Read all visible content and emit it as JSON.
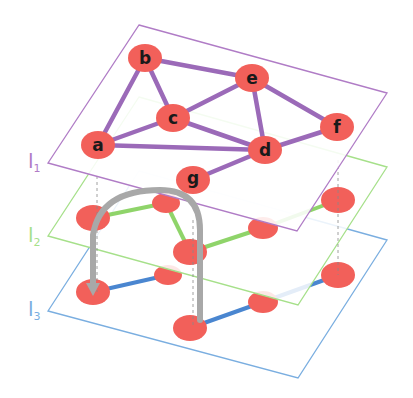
{
  "diagram": {
    "type": "multilayer-network",
    "colors": {
      "node": "#f2605a",
      "l1": "#b07cc6",
      "l1_edge": "#9b6ab8",
      "l2": "#a6e08a",
      "l2_edge": "#8fd46a",
      "l3": "#7aaee0",
      "l3_edge": "#4a86d0",
      "arrow": "#a8a8a8",
      "label_text": "#1a1a1a"
    },
    "layers": [
      {
        "id": "l1",
        "label": "l",
        "subscript": "1"
      },
      {
        "id": "l2",
        "label": "l",
        "subscript": "2"
      },
      {
        "id": "l3",
        "label": "l",
        "subscript": "3"
      }
    ],
    "nodes_l1": [
      {
        "id": "a",
        "label": "a"
      },
      {
        "id": "b",
        "label": "b"
      },
      {
        "id": "c",
        "label": "c"
      },
      {
        "id": "d",
        "label": "d"
      },
      {
        "id": "e",
        "label": "e"
      },
      {
        "id": "f",
        "label": "f"
      },
      {
        "id": "g",
        "label": "g"
      }
    ],
    "edges_l1": [
      [
        "a",
        "b"
      ],
      [
        "b",
        "c"
      ],
      [
        "b",
        "e"
      ],
      [
        "a",
        "c"
      ],
      [
        "a",
        "d"
      ],
      [
        "c",
        "e"
      ],
      [
        "c",
        "d"
      ],
      [
        "e",
        "d"
      ],
      [
        "e",
        "f"
      ],
      [
        "d",
        "f"
      ],
      [
        "d",
        "g"
      ]
    ],
    "interlayer_arrow": {
      "from_layer": "l3",
      "to_layer": "l2",
      "description": "curved gray arrow between layers"
    }
  }
}
